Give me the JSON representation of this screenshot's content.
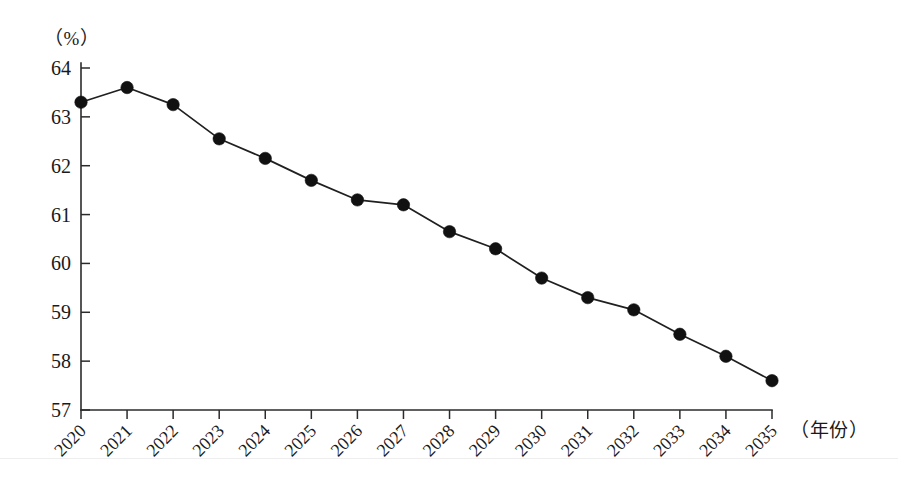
{
  "chart_data": {
    "type": "line",
    "title": "",
    "subtitle": "",
    "xlabel": "（年份）",
    "ylabel": "（%）",
    "unit_label": "（%）",
    "x_axis_name": "（年份）",
    "categories": [
      "2020",
      "2021",
      "2022",
      "2023",
      "2024",
      "2025",
      "2026",
      "2027",
      "2028",
      "2029",
      "2030",
      "2031",
      "2032",
      "2033",
      "2034",
      "2035"
    ],
    "values": [
      63.3,
      63.6,
      63.25,
      62.55,
      62.15,
      61.7,
      61.3,
      61.2,
      60.65,
      60.3,
      59.7,
      59.3,
      59.05,
      58.55,
      58.1,
      57.6
    ],
    "series": [
      {
        "name": "",
        "values": [
          63.3,
          63.6,
          63.25,
          62.55,
          62.15,
          61.7,
          61.3,
          61.2,
          60.65,
          60.3,
          59.7,
          59.3,
          59.05,
          58.55,
          58.1,
          57.6
        ]
      }
    ],
    "ylim": [
      57,
      64
    ],
    "xlim": [
      "2020",
      "2035"
    ],
    "yticks": [
      57,
      58,
      59,
      60,
      61,
      62,
      63,
      64
    ],
    "ytick_labels": [
      "57",
      "58",
      "59",
      "60",
      "61",
      "62",
      "63",
      "64"
    ],
    "xtick_labels": [
      "2020",
      "2021",
      "2022",
      "2023",
      "2024",
      "2025",
      "2026",
      "2027",
      "2028",
      "2029",
      "2030",
      "2031",
      "2032",
      "2033",
      "2034",
      "2035"
    ],
    "grid": false,
    "legend": false,
    "legend_position": "none",
    "marker": "filled-circle",
    "line_color": "#202020",
    "marker_color": "#111111",
    "background_color": "#ffffff",
    "x_label_rotation": -45,
    "annotations": []
  },
  "figure": {
    "unit_label": "（%）",
    "x_axis_name": "（年份）"
  }
}
